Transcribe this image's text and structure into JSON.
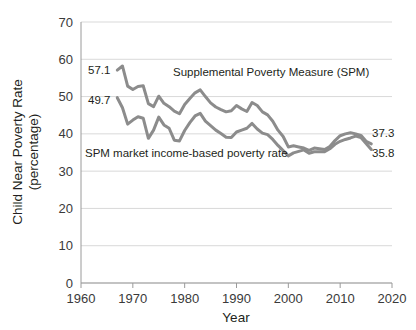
{
  "chart_data": {
    "type": "line",
    "title": "",
    "xlabel": "Year",
    "ylabel": "Child Near Poverty Rate (percentage)",
    "ylabel_line1": "Child Near Poverty Rate",
    "ylabel_line2": "(percentage)",
    "xlim": [
      1960,
      2020
    ],
    "ylim": [
      0,
      70
    ],
    "xticks": [
      1960,
      1970,
      1980,
      1990,
      2000,
      2010,
      2020
    ],
    "yticks": [
      0,
      10,
      20,
      30,
      40,
      50,
      60,
      70
    ],
    "grid": "horizontal",
    "legend": "inline-annotations",
    "colors": {
      "spm_line": "#8c8c8c",
      "market_line": "#8c8c8c",
      "grid": "#d9d9d9",
      "axis": "#9a9a9a",
      "text": "#231f20"
    },
    "series": [
      {
        "name": "Supplemental Poverty Measure (SPM)",
        "x": [
          1967,
          1968,
          1969,
          1970,
          1971,
          1972,
          1973,
          1974,
          1975,
          1976,
          1977,
          1978,
          1979,
          1980,
          1981,
          1982,
          1983,
          1984,
          1985,
          1986,
          1987,
          1988,
          1989,
          1990,
          1991,
          1992,
          1993,
          1994,
          1995,
          1996,
          1997,
          1998,
          1999,
          2000,
          2001,
          2002,
          2003,
          2004,
          2005,
          2006,
          2007,
          2008,
          2009,
          2010,
          2011,
          2012,
          2013,
          2014,
          2015,
          2016
        ],
        "values": [
          57.1,
          58.2,
          52.8,
          51.9,
          52.7,
          52.9,
          48.1,
          47.3,
          50.1,
          48.2,
          47.3,
          46.1,
          45.4,
          47.9,
          49.5,
          51.0,
          51.8,
          50.0,
          48.3,
          47.2,
          46.5,
          45.9,
          46.2,
          47.6,
          46.7,
          46.0,
          48.4,
          47.6,
          45.9,
          45.1,
          43.4,
          41.0,
          39.3,
          36.5,
          36.8,
          36.5,
          36.2,
          35.6,
          36.2,
          36.0,
          35.8,
          36.6,
          38.2,
          39.5,
          40.0,
          40.3,
          40.0,
          39.6,
          38.0,
          37.3
        ],
        "label_start": "57.1",
        "label_end": "37.3"
      },
      {
        "name": "SPM market income-based poverty rate",
        "x": [
          1967,
          1968,
          1969,
          1970,
          1971,
          1972,
          1973,
          1974,
          1975,
          1976,
          1977,
          1978,
          1979,
          1980,
          1981,
          1982,
          1983,
          1984,
          1985,
          1986,
          1987,
          1988,
          1989,
          1990,
          1991,
          1992,
          1993,
          1994,
          1995,
          1996,
          1997,
          1998,
          1999,
          2000,
          2001,
          2002,
          2003,
          2004,
          2005,
          2006,
          2007,
          2008,
          2009,
          2010,
          2011,
          2012,
          2013,
          2014,
          2015,
          2016
        ],
        "values": [
          49.7,
          47.0,
          42.6,
          43.7,
          44.6,
          44.2,
          38.8,
          41.0,
          44.5,
          42.4,
          41.5,
          38.3,
          38.1,
          40.9,
          43.0,
          44.8,
          45.5,
          43.4,
          42.2,
          41.0,
          40.1,
          39.1,
          39.0,
          40.5,
          41.0,
          41.5,
          42.8,
          41.3,
          40.2,
          39.8,
          38.5,
          36.9,
          35.5,
          34.1,
          34.9,
          35.3,
          35.7,
          34.8,
          35.2,
          35.2,
          35.2,
          36.0,
          37.2,
          38.0,
          38.5,
          38.9,
          39.4,
          39.0,
          37.4,
          35.8
        ],
        "label_start": "49.7",
        "label_end": "35.8"
      }
    ],
    "annotations": [
      {
        "id": "spm-series-label",
        "text": "Supplemental Poverty Measure (SPM)",
        "x": 173,
        "y": 76
      },
      {
        "id": "market-series-label",
        "text": "SPM market income-based poverty rate",
        "x": 85,
        "y": 157
      },
      {
        "id": "start-label-spm",
        "text": "57.1",
        "x": 88,
        "y": 74
      },
      {
        "id": "start-label-market",
        "text": "49.7",
        "x": 88,
        "y": 104
      },
      {
        "id": "end-label-spm",
        "text": "37.3",
        "x": 372,
        "y": 137
      },
      {
        "id": "end-label-market",
        "text": "35.8",
        "x": 372,
        "y": 157
      }
    ]
  }
}
